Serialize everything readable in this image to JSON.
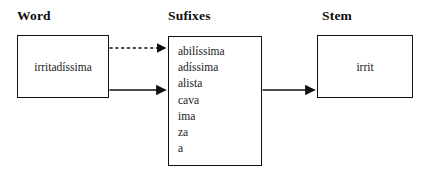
{
  "diagram": {
    "background_color": "#ffffff",
    "line_color": "#111111",
    "text_color": "#1a1a1a",
    "columns": {
      "word": {
        "heading": "Word"
      },
      "suffixes": {
        "heading": "Sufixes"
      },
      "stem": {
        "heading": "Stem"
      }
    },
    "word_box": {
      "value": "irritadíssima"
    },
    "suffix_box": {
      "items": [
        "abilíssima",
        "adíssima",
        "alista",
        "cava",
        "ima",
        "za",
        "a"
      ]
    },
    "stem_box": {
      "value": "irrit"
    },
    "connectors": [
      {
        "name": "word-to-suffix-dashed",
        "style": "dashed",
        "from": "word_box",
        "to": "suffix_box",
        "arrowhead": true
      },
      {
        "name": "word-to-suffix-solid",
        "style": "solid",
        "from": "word_box",
        "to": "suffix_box",
        "arrowhead": true
      },
      {
        "name": "suffix-to-stem-solid",
        "style": "solid",
        "from": "suffix_box",
        "to": "stem_box",
        "arrowhead": true
      }
    ]
  }
}
